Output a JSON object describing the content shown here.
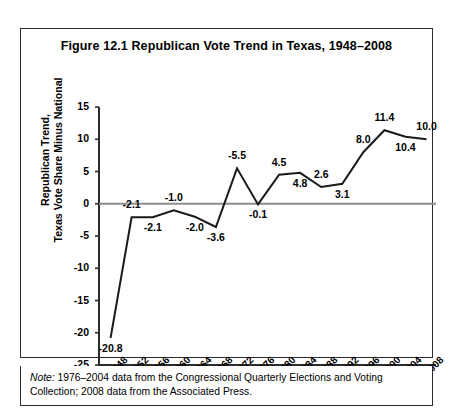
{
  "figure": {
    "title": "Figure 12.1  Republican Vote Trend in Texas, 1948–2008",
    "note_lead": "Note:",
    "note_body": " 1976–2004 data from the Congressional Quarterly Elections and Voting Collection; 2008 data from the Associated Press."
  },
  "chart_data": {
    "type": "line",
    "title": "Figure 12.1  Republican Vote Trend in Texas, 1948–2008",
    "xlabel": "",
    "ylabel": "Republican Trend,\nTexas Vote Share Minus National",
    "ylabel_line1": "Republican Trend,",
    "ylabel_line2": "Texas Vote Share Minus National",
    "categories": [
      "1948",
      "1952",
      "1956",
      "1960",
      "1964",
      "1968",
      "1972",
      "1976",
      "1980",
      "1984",
      "1988",
      "1992",
      "1996",
      "2000",
      "2004",
      "2008"
    ],
    "values": [
      -20.8,
      -2.1,
      -2.1,
      -1.0,
      -2.0,
      -3.6,
      5.5,
      -0.1,
      4.5,
      4.8,
      2.6,
      3.1,
      8.0,
      11.4,
      10.4,
      10.0
    ],
    "point_labels": [
      "-20.8",
      "-2.1",
      "-2.1",
      "-1.0",
      "-2.0",
      "-3.6",
      "-5.5",
      "-0.1",
      "4.5",
      "4.8",
      "2.6",
      "3.1",
      "8.0",
      "11.4",
      "10.4",
      "10.0"
    ],
    "label_position": [
      "below",
      "above",
      "below",
      "above",
      "below",
      "below",
      "above",
      "below",
      "above",
      "below",
      "above",
      "below",
      "above",
      "above",
      "below",
      "above"
    ],
    "yticks": [
      15,
      10,
      5,
      0,
      -5,
      -10,
      -15,
      -20,
      -25
    ],
    "ytick_labels": [
      "15",
      "10",
      "5",
      "0",
      "-5",
      "-10",
      "-15",
      "-20",
      "-25"
    ],
    "ylim": [
      -25,
      15
    ],
    "grid": false,
    "legend": "none",
    "zero_line": true,
    "line_color": "#1a1a1a",
    "axis_color": "#2b2b2b",
    "zero_line_color": "#8c8c8c"
  }
}
